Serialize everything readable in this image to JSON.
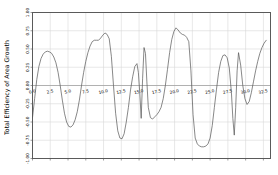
{
  "chart_data": {
    "type": "line",
    "title": "",
    "xlabel": "",
    "ylabel": "Total Efficiency of Area Growth",
    "xlim": [
      0.0,
      33.5
    ],
    "ylim": [
      -1.0,
      1.0
    ],
    "grid": true,
    "legend": null,
    "line_color": "#555555",
    "grid_color": "#d9d9d9",
    "axis_color": "#5a5a5a",
    "background_color": "#ffffff",
    "xticks": [
      0.0,
      2.5,
      5.0,
      7.5,
      10.0,
      12.5,
      15.0,
      17.5,
      20.0,
      22.5,
      25.0,
      27.5,
      30.0,
      32.5
    ],
    "xtick_labels": [
      "0.0",
      "2.5",
      "5.0",
      "7.5",
      "10.0",
      "12.5",
      "15.0",
      "17.5",
      "20.0",
      "22.5",
      "25.0",
      "27.5",
      "30.0",
      "32.5"
    ],
    "yticks": [
      -1.0,
      -0.75,
      -0.5,
      -0.25,
      0.0,
      0.25,
      0.5,
      0.75,
      1.0
    ],
    "ytick_labels": [
      "-1.00",
      "-0.75",
      "-0.50",
      "-0.25",
      "0.00",
      "0.25",
      "0.50",
      "0.75",
      "1.00"
    ],
    "x": [
      0.0,
      0.3,
      0.6,
      0.9,
      1.2,
      1.5,
      1.8,
      2.1,
      2.4,
      2.7,
      3.0,
      3.3,
      3.6,
      3.9,
      4.2,
      4.5,
      4.8,
      5.1,
      5.4,
      5.7,
      6.0,
      6.3,
      6.6,
      6.9,
      7.2,
      7.5,
      7.8,
      8.1,
      8.4,
      8.7,
      9.0,
      9.3,
      9.6,
      9.9,
      10.2,
      10.5,
      10.8,
      11.1,
      11.4,
      11.7,
      12.0,
      12.3,
      12.6,
      12.9,
      13.2,
      13.5,
      13.8,
      14.1,
      14.4,
      14.7,
      14.9,
      15.1,
      15.3,
      15.5,
      15.7,
      15.9,
      16.1,
      16.3,
      16.6,
      16.9,
      17.2,
      17.5,
      17.8,
      18.1,
      18.4,
      18.7,
      19.0,
      19.3,
      19.6,
      19.9,
      20.2,
      20.5,
      20.8,
      21.1,
      21.4,
      21.7,
      22.0,
      22.3,
      22.6,
      22.9,
      23.2,
      23.5,
      23.8,
      24.1,
      24.4,
      24.7,
      25.0,
      25.3,
      25.6,
      25.9,
      26.2,
      26.5,
      26.8,
      27.1,
      27.4,
      27.7,
      28.0,
      28.2,
      28.4,
      28.6,
      28.8,
      29.0,
      29.3,
      29.6,
      29.9,
      30.2,
      30.5,
      30.8,
      31.1,
      31.4,
      31.7,
      32.0,
      32.3,
      32.6,
      32.9,
      33.2
    ],
    "y": [
      -0.44,
      -0.18,
      0.08,
      0.26,
      0.37,
      0.43,
      0.46,
      0.47,
      0.46,
      0.44,
      0.39,
      0.31,
      0.18,
      0.0,
      -0.2,
      -0.38,
      -0.5,
      -0.56,
      -0.57,
      -0.54,
      -0.47,
      -0.36,
      -0.2,
      0.0,
      0.18,
      0.33,
      0.45,
      0.54,
      0.6,
      0.62,
      0.62,
      0.62,
      0.65,
      0.69,
      0.72,
      0.7,
      0.64,
      0.4,
      0.0,
      -0.38,
      -0.62,
      -0.72,
      -0.73,
      -0.66,
      -0.5,
      -0.3,
      -0.06,
      0.12,
      0.26,
      0.3,
      0.18,
      -0.1,
      -0.45,
      0.1,
      0.52,
      0.44,
      0.05,
      -0.3,
      -0.44,
      -0.46,
      -0.43,
      -0.4,
      -0.36,
      -0.3,
      -0.18,
      0.0,
      0.22,
      0.45,
      0.63,
      0.74,
      0.79,
      0.76,
      0.72,
      0.7,
      0.69,
      0.66,
      0.6,
      0.2,
      -0.4,
      -0.72,
      -0.8,
      -0.83,
      -0.84,
      -0.84,
      -0.83,
      -0.8,
      -0.72,
      -0.55,
      -0.3,
      -0.05,
      0.18,
      0.33,
      0.41,
      0.42,
      0.38,
      0.24,
      -0.1,
      -0.45,
      -0.68,
      -0.3,
      0.2,
      0.45,
      0.28,
      0.0,
      -0.18,
      -0.26,
      -0.22,
      -0.1,
      0.05,
      0.2,
      0.33,
      0.44,
      0.52,
      0.58,
      0.62
    ]
  }
}
